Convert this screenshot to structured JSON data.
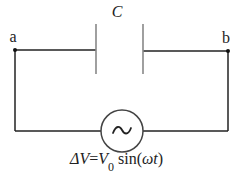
{
  "diagram": {
    "type": "circuit",
    "capacitor": {
      "label": "C"
    },
    "nodes": [
      {
        "id": "a",
        "label": "a"
      },
      {
        "id": "b",
        "label": "b"
      }
    ],
    "source": {
      "symbol": "~",
      "icon": "ac-source-icon",
      "formula": {
        "lhs": "ΔV",
        "eq": "=",
        "amp": "V",
        "sub": "0",
        "func": " sin(",
        "omega": "ω",
        "t": "t",
        "close": ")"
      }
    },
    "colors": {
      "wire": "#222222",
      "plate": "#888888",
      "text": "#222222"
    }
  }
}
